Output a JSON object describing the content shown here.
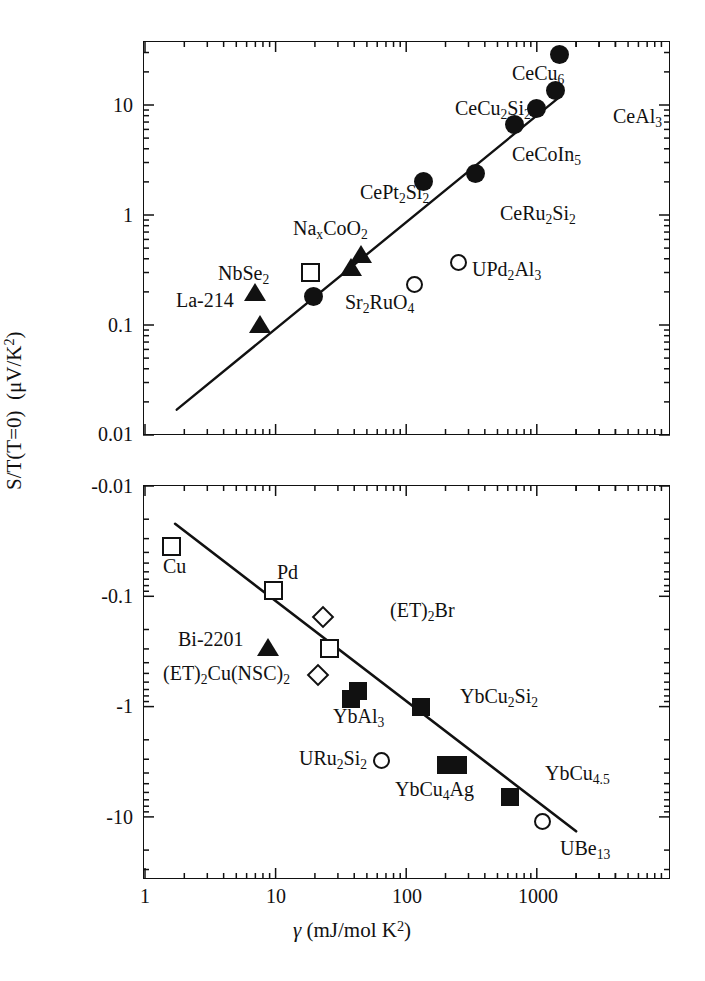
{
  "figure": {
    "xlabel": "γ (mJ/mol K²)",
    "ylabel": "S/T(T=0)  (μV/K²)"
  },
  "chart_data": {
    "type": "scatter",
    "title": "",
    "xlabel": "γ (mJ/mol K²)",
    "ylabel": "S/T(T=0) (μV/K²)",
    "xscale": "log",
    "yscale": "log",
    "xlim": [
      1,
      4000
    ],
    "xticks": [
      "1",
      "10",
      "100",
      "1000"
    ],
    "grid": false,
    "legend": "none",
    "panels": [
      {
        "name": "upper-panel",
        "ylim": [
          0.01,
          40
        ],
        "yticks": [
          "10",
          "1",
          "0.1",
          "0.01"
        ],
        "ysign": "positive",
        "fit_line": {
          "x1": 1.75,
          "y1": 0.017,
          "x2": 1450,
          "y2": 11.5
        },
        "points": [
          {
            "label": "La-214",
            "x": 7.0,
            "y": 0.19,
            "marker": "triangle-filled"
          },
          {
            "label": "La-214",
            "x": 7.6,
            "y": 0.098,
            "marker": "triangle-filled"
          },
          {
            "label": "NbSe2",
            "x": 18.5,
            "y": 0.3,
            "marker": "square-open"
          },
          {
            "label": "Sr2RuO4",
            "x": 19.5,
            "y": 0.182,
            "marker": "circle-filled"
          },
          {
            "label": "NaxCoO2",
            "x": 38.0,
            "y": 0.32,
            "marker": "triangle-filled"
          },
          {
            "label": "NaxCoO2",
            "x": 45.0,
            "y": 0.42,
            "marker": "triangle-filled"
          },
          {
            "label": "UPd2Al3",
            "x": 115.0,
            "y": 0.235,
            "marker": "circle-open"
          },
          {
            "label": "CePt2Si2",
            "x": 135.0,
            "y": 2.0,
            "marker": "circle-filled"
          },
          {
            "label": "CeRu2Si2",
            "x": 340.0,
            "y": 2.4,
            "marker": "circle-filled"
          },
          {
            "label": "CeCoIn5",
            "x": 670.0,
            "y": 6.7,
            "marker": "circle-filled"
          },
          {
            "label": "CeCu2Si2",
            "x": 1000.0,
            "y": 9.2,
            "marker": "circle-filled"
          },
          {
            "label": "CeAl3",
            "x": 1400.0,
            "y": 13.5,
            "marker": "circle-filled"
          },
          {
            "label": "CeCu6",
            "x": 1500.0,
            "y": 29.0,
            "marker": "circle-filled"
          }
        ],
        "annotations": [
          {
            "text": "CeCu6",
            "html": "CeCu<sub>6</sub>",
            "x": 512,
            "y": 63
          },
          {
            "text": "CeCu2Si2",
            "html": "CeCu<sub>2</sub>Si<sub>2</sub>",
            "x": 455,
            "y": 98
          },
          {
            "text": "CeAl3",
            "html": "CeAl<sub>3</sub>",
            "x": 613,
            "y": 106
          },
          {
            "text": "CeCoIn5",
            "html": "CeCoIn<sub>5</sub>",
            "x": 512,
            "y": 144
          },
          {
            "text": "CePt2Si2",
            "html": "CePt<sub>2</sub>Si<sub>2</sub>",
            "x": 360,
            "y": 182
          },
          {
            "text": "CeRu2Si2",
            "html": "CeRu<sub>2</sub>Si<sub>2</sub>",
            "x": 500,
            "y": 203
          },
          {
            "text": "NaxCoO2",
            "html": "Na<sub>x</sub>CoO<sub>2</sub>",
            "x": 293,
            "y": 218
          },
          {
            "text": "NbSe2",
            "html": "NbSe<sub>2</sub>",
            "x": 218,
            "y": 263
          },
          {
            "text": "UPd2Al3",
            "html": "UPd<sub>2</sub>Al<sub>3</sub>",
            "x": 472,
            "y": 259
          },
          {
            "text": "La-214",
            "html": "La-214",
            "x": 176,
            "y": 290
          },
          {
            "text": "Sr2RuO4",
            "html": "Sr<sub>2</sub>RuO<sub>4</sub>",
            "x": 345,
            "y": 292
          }
        ]
      },
      {
        "name": "lower-panel",
        "ylim": [
          -0.01,
          -40
        ],
        "yticks": [
          "-0.01",
          "-0.1",
          "-1",
          "-10"
        ],
        "ysign": "negative",
        "fit_line": {
          "x1": 1.7,
          "y1": -0.022,
          "x2": 2000,
          "y2": -13.5
        },
        "points": [
          {
            "label": "Cu",
            "x": 1.6,
            "y": -0.035,
            "marker": "square-open"
          },
          {
            "label": "Pd",
            "x": 9.6,
            "y": -0.088,
            "marker": "square-open"
          },
          {
            "label": "Bi-2201",
            "x": 8.8,
            "y": -0.3,
            "marker": "triangle-filled"
          },
          {
            "label": "(ET)2Br",
            "x": 23.0,
            "y": -0.155,
            "marker": "diamond-open"
          },
          {
            "label": "(ET)2Br",
            "x": 26.0,
            "y": -0.3,
            "marker": "square-open"
          },
          {
            "label": "(ET)2Cu(NSC)2",
            "x": 21.0,
            "y": -0.52,
            "marker": "diamond-open"
          },
          {
            "label": "YbAl3",
            "x": 38.0,
            "y": -0.86,
            "marker": "square-filled"
          },
          {
            "label": "YbAl3",
            "x": 43.0,
            "y": -0.72,
            "marker": "square-filled"
          },
          {
            "label": "URu2Si2",
            "x": 65.0,
            "y": -3.1,
            "marker": "circle-open"
          },
          {
            "label": "YbCu2Si2",
            "x": 130.0,
            "y": -1.0,
            "marker": "square-filled"
          },
          {
            "label": "YbCu4Ag",
            "x": 200.0,
            "y": -3.4,
            "marker": "square-filled"
          },
          {
            "label": "YbCu4Ag",
            "x": 250.0,
            "y": -3.4,
            "marker": "square-filled"
          },
          {
            "label": "YbCu4.5",
            "x": 620.0,
            "y": -6.6,
            "marker": "square-filled"
          },
          {
            "label": "UBe13",
            "x": 1100.0,
            "y": -11.0,
            "marker": "circle-open"
          }
        ],
        "annotations": [
          {
            "text": "Cu",
            "html": "Cu",
            "x": 163,
            "y": 556
          },
          {
            "text": "Pd",
            "html": "Pd",
            "x": 277,
            "y": 562
          },
          {
            "text": "(ET)2Br",
            "html": "(ET)<sub>2</sub>Br",
            "x": 390,
            "y": 600
          },
          {
            "text": "Bi-2201",
            "html": "Bi-2201",
            "x": 178,
            "y": 629
          },
          {
            "text": "(ET)2Cu(NSC)2",
            "html": "(ET)<sub>2</sub>Cu(NSC)<sub>2</sub>",
            "x": 163,
            "y": 663
          },
          {
            "text": "YbCu2Si2",
            "html": "YbCu<sub>2</sub>Si<sub>2</sub>",
            "x": 460,
            "y": 686
          },
          {
            "text": "YbAl3",
            "html": "YbAl<sub>3</sub>",
            "x": 333,
            "y": 706
          },
          {
            "text": "URu2Si2",
            "html": "URu<sub>2</sub>Si<sub>2</sub>",
            "x": 299,
            "y": 748
          },
          {
            "text": "YbCu4.5",
            "html": "YbCu<sub>4.5</sub>",
            "x": 545,
            "y": 763
          },
          {
            "text": "YbCu4Ag",
            "html": "YbCu<sub>4</sub>Ag",
            "x": 395,
            "y": 779
          },
          {
            "text": "UBe13",
            "html": "UBe<sub>13</sub>",
            "x": 560,
            "y": 838
          }
        ]
      }
    ]
  },
  "colors": {
    "ink": "#111111",
    "background": "#ffffff"
  }
}
